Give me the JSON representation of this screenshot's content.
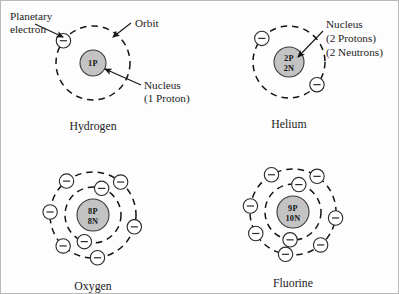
{
  "figure": {
    "background_color": "#fdfdfd",
    "border_color": "#b9b9b9",
    "ink_color": "#141414",
    "nucleus_fill": "#c3c3c3",
    "electron_fill": "#ffffff"
  },
  "annotations": {
    "planetary_electron_line1": "Planetary",
    "planetary_electron_line2": "electron",
    "orbit": "Orbit",
    "hydrogen_nucleus_line1": "Nucleus",
    "hydrogen_nucleus_line2": "(1 Proton)",
    "helium_nucleus_line1": "Nucleus",
    "helium_nucleus_line2": "(2 Protons)",
    "helium_nucleus_line3": "(2 Neutrons)"
  },
  "atoms": [
    {
      "id": "hydrogen",
      "name": "Hydrogen",
      "nucleus_lines": [
        "1P"
      ],
      "protons": 1,
      "neutrons": 0,
      "center": {
        "x": 92,
        "y": 62
      },
      "nucleus_radius": 13,
      "shells": [
        {
          "radius": 37,
          "electron_count": 1,
          "electron_angles": [
            143
          ]
        }
      ]
    },
    {
      "id": "helium",
      "name": "Helium",
      "nucleus_lines": [
        "2P",
        "2N"
      ],
      "protons": 2,
      "neutrons": 2,
      "center": {
        "x": 288,
        "y": 61
      },
      "nucleus_radius": 15,
      "shells": [
        {
          "radius": 36,
          "electron_count": 2,
          "electron_angles": [
            139,
            -39
          ]
        }
      ]
    },
    {
      "id": "oxygen",
      "name": "Oxygen",
      "nucleus_lines": [
        "8P",
        "8N"
      ],
      "protons": 8,
      "neutrons": 8,
      "center": {
        "x": 92,
        "y": 214
      },
      "nucleus_radius": 16,
      "shells": [
        {
          "radius": 28,
          "electron_count": 2,
          "electron_angles": [
            72,
            -108
          ]
        },
        {
          "radius": 43,
          "electron_count": 6,
          "electron_angles": [
            50,
            128,
            176,
            -134,
            -84,
            -16
          ]
        }
      ]
    },
    {
      "id": "fluorine",
      "name": "Fluorine",
      "nucleus_lines": [
        "9P",
        "10N"
      ],
      "protons": 9,
      "neutrons": 10,
      "center": {
        "x": 292,
        "y": 211
      },
      "nucleus_radius": 16,
      "shells": [
        {
          "radius": 28,
          "electron_count": 2,
          "electron_angles": [
            78,
            -96
          ]
        },
        {
          "radius": 43,
          "electron_count": 7,
          "electron_angles": [
            56,
            120,
            172,
            -150,
            -100,
            -50,
            -8
          ]
        }
      ]
    }
  ],
  "leaders": [
    {
      "id": "planetary-electron-leader",
      "from": {
        "x": 34,
        "y": 23
      },
      "to": {
        "x": 62,
        "y": 36
      }
    },
    {
      "id": "orbit-leader",
      "from": {
        "x": 130,
        "y": 22
      },
      "to": {
        "x": 112,
        "y": 36
      }
    },
    {
      "id": "hydrogen-nucleus-leader",
      "from": {
        "x": 140,
        "y": 84
      },
      "to": {
        "x": 104,
        "y": 68
      }
    },
    {
      "id": "helium-nucleus-leader",
      "from": {
        "x": 322,
        "y": 30
      },
      "to": {
        "x": 297,
        "y": 56
      }
    }
  ]
}
